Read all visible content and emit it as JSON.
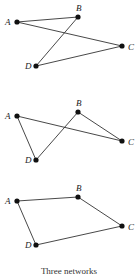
{
  "figures": [
    {
      "name": "network-1",
      "nodes": {
        "A": [
          17,
          22
        ],
        "B": [
          78,
          17
        ],
        "C": [
          122,
          46
        ],
        "D": [
          36,
          66
        ]
      },
      "edges": [
        [
          "A",
          "B"
        ],
        [
          "A",
          "C"
        ],
        [
          "B",
          "D"
        ],
        [
          "D",
          "C"
        ]
      ]
    },
    {
      "name": "network-2",
      "nodes": {
        "A": [
          17,
          116
        ],
        "B": [
          78,
          112
        ],
        "C": [
          122,
          141
        ],
        "D": [
          36,
          160
        ]
      },
      "edges": [
        [
          "A",
          "C"
        ],
        [
          "A",
          "D"
        ],
        [
          "D",
          "B"
        ],
        [
          "B",
          "C"
        ]
      ]
    },
    {
      "name": "network-3",
      "nodes": {
        "A": [
          17,
          201
        ],
        "B": [
          78,
          197
        ],
        "C": [
          122,
          226
        ],
        "D": [
          36,
          245
        ]
      },
      "edges": [
        [
          "A",
          "B"
        ],
        [
          "B",
          "C"
        ],
        [
          "C",
          "D"
        ],
        [
          "D",
          "A"
        ]
      ]
    }
  ],
  "labels": {
    "A": "A",
    "B": "B",
    "C": "C",
    "D": "D"
  },
  "caption": "Three networks"
}
